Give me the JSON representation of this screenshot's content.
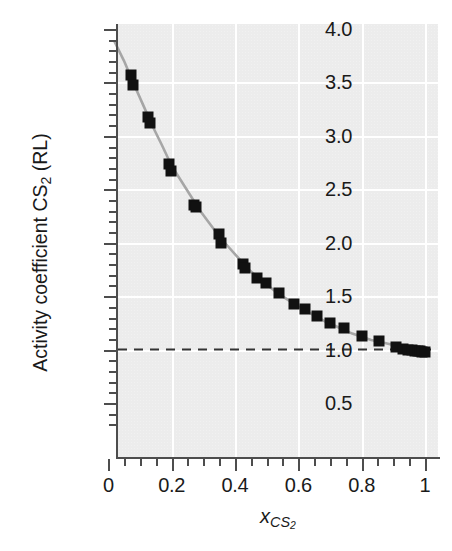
{
  "chart_data": {
    "type": "scatter",
    "title": "",
    "xlabel": "x_CS2",
    "xlabel_base": "x",
    "xlabel_sub": "CS",
    "xlabel_sub2": "2",
    "ylabel": "Activity coefficient CS2 (RL)",
    "ylabel_pre": "Activity coefficient CS",
    "ylabel_sub": "2",
    "ylabel_post": " (RL)",
    "xlim": [
      0,
      1.04
    ],
    "ylim": [
      0.28,
      4.0
    ],
    "grid": true,
    "grid_color": "#ffffff",
    "panel_color": "#ececec",
    "legend": "none",
    "marker_color": "#111111",
    "marker_shape": "square",
    "curve_color": "#a6a6a6",
    "reference_line": {
      "name": "ideal-line",
      "y": 1.0,
      "style": "dashed",
      "color": "#333333"
    },
    "x_ticks_major": [
      0,
      0.2,
      0.4,
      0.6,
      0.8,
      1
    ],
    "x_ticklabels": [
      "0",
      "0.2",
      "0.4",
      "0.6",
      "0.8",
      "1"
    ],
    "x_ticks_minor": [
      0.05,
      0.1,
      0.15,
      0.25,
      0.3,
      0.35,
      0.45,
      0.5,
      0.55,
      0.65,
      0.7,
      0.75,
      0.85,
      0.9,
      0.95
    ],
    "y_ticks_major": [
      0.5,
      1.0,
      1.5,
      2.0,
      2.5,
      3.0,
      3.5,
      4.0
    ],
    "y_ticklabels": [
      "0.5",
      "1.0",
      "1.5",
      "2.0",
      "2.5",
      "3.0",
      "3.5",
      "4.0"
    ],
    "y_ticks_minor": [
      0.3,
      0.4,
      0.6,
      0.7,
      0.8,
      0.9,
      1.1,
      1.2,
      1.3,
      1.4,
      1.6,
      1.7,
      1.8,
      1.9,
      2.1,
      2.2,
      2.3,
      2.4,
      2.6,
      2.7,
      2.8,
      2.9,
      3.1,
      3.2,
      3.3,
      3.4,
      3.6,
      3.7,
      3.8,
      3.9
    ],
    "y_gridlines": [
      1.0,
      1.5,
      2.0,
      2.5,
      3.0,
      3.5
    ],
    "x_gridlines": [
      0.2,
      0.4,
      0.6,
      0.8,
      1.0
    ],
    "points": [
      {
        "x": 0.072,
        "y": 3.57
      },
      {
        "x": 0.078,
        "y": 3.48
      },
      {
        "x": 0.125,
        "y": 3.18
      },
      {
        "x": 0.133,
        "y": 3.12
      },
      {
        "x": 0.192,
        "y": 2.74
      },
      {
        "x": 0.198,
        "y": 2.67
      },
      {
        "x": 0.272,
        "y": 2.35
      },
      {
        "x": 0.277,
        "y": 2.33
      },
      {
        "x": 0.35,
        "y": 2.08
      },
      {
        "x": 0.356,
        "y": 2.0
      },
      {
        "x": 0.424,
        "y": 1.8
      },
      {
        "x": 0.432,
        "y": 1.76
      },
      {
        "x": 0.47,
        "y": 1.67
      },
      {
        "x": 0.498,
        "y": 1.62
      },
      {
        "x": 0.54,
        "y": 1.53
      },
      {
        "x": 0.585,
        "y": 1.43
      },
      {
        "x": 0.62,
        "y": 1.38
      },
      {
        "x": 0.66,
        "y": 1.31
      },
      {
        "x": 0.7,
        "y": 1.25
      },
      {
        "x": 0.745,
        "y": 1.2
      },
      {
        "x": 0.8,
        "y": 1.13
      },
      {
        "x": 0.855,
        "y": 1.08
      },
      {
        "x": 0.91,
        "y": 1.02
      },
      {
        "x": 0.93,
        "y": 1.01
      },
      {
        "x": 0.945,
        "y": 1.0
      },
      {
        "x": 0.958,
        "y": 1.0
      },
      {
        "x": 0.968,
        "y": 0.99
      },
      {
        "x": 0.977,
        "y": 0.99
      },
      {
        "x": 0.985,
        "y": 0.99
      },
      {
        "x": 0.992,
        "y": 0.98
      },
      {
        "x": 1.0,
        "y": 0.98
      }
    ],
    "model_curve": [
      {
        "x": 0.02,
        "y": 3.88
      },
      {
        "x": 0.05,
        "y": 3.7
      },
      {
        "x": 0.08,
        "y": 3.49
      },
      {
        "x": 0.11,
        "y": 3.29
      },
      {
        "x": 0.14,
        "y": 3.09
      },
      {
        "x": 0.17,
        "y": 2.91
      },
      {
        "x": 0.2,
        "y": 2.72
      },
      {
        "x": 0.23,
        "y": 2.58
      },
      {
        "x": 0.26,
        "y": 2.44
      },
      {
        "x": 0.29,
        "y": 2.3
      },
      {
        "x": 0.32,
        "y": 2.18
      },
      {
        "x": 0.35,
        "y": 2.06
      },
      {
        "x": 0.38,
        "y": 1.96
      },
      {
        "x": 0.41,
        "y": 1.86
      },
      {
        "x": 0.44,
        "y": 1.76
      },
      {
        "x": 0.47,
        "y": 1.68
      },
      {
        "x": 0.5,
        "y": 1.61
      },
      {
        "x": 0.53,
        "y": 1.54
      },
      {
        "x": 0.56,
        "y": 1.48
      },
      {
        "x": 0.59,
        "y": 1.42
      },
      {
        "x": 0.62,
        "y": 1.37
      },
      {
        "x": 0.65,
        "y": 1.32
      },
      {
        "x": 0.68,
        "y": 1.27
      },
      {
        "x": 0.71,
        "y": 1.23
      },
      {
        "x": 0.74,
        "y": 1.19
      },
      {
        "x": 0.77,
        "y": 1.15
      },
      {
        "x": 0.8,
        "y": 1.12
      },
      {
        "x": 0.83,
        "y": 1.09
      },
      {
        "x": 0.86,
        "y": 1.07
      },
      {
        "x": 0.89,
        "y": 1.05
      },
      {
        "x": 0.92,
        "y": 1.03
      },
      {
        "x": 0.95,
        "y": 1.01
      },
      {
        "x": 0.98,
        "y": 1.0
      },
      {
        "x": 1.0,
        "y": 0.99
      }
    ]
  },
  "geometry": {
    "panel_left": 118,
    "panel_top": 24,
    "panel_width": 320,
    "panel_height": 434,
    "x0_px": 108.3,
    "x_scale_px": 316.7,
    "y_ref_value": 4.0,
    "y_ref_px": 29,
    "y_scale_px": 106.86
  }
}
